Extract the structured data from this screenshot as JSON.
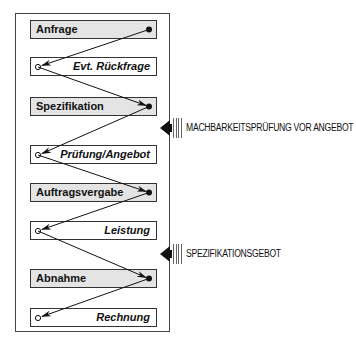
{
  "diagram": {
    "steps": [
      {
        "label": "Anfrage",
        "kind": "action",
        "endpoint": "filled-dot"
      },
      {
        "label": "Evt. Rückfrage",
        "kind": "response",
        "endpoint": "open-circle"
      },
      {
        "label": "Spezifikation",
        "kind": "action",
        "endpoint": "filled-dot"
      },
      {
        "label": "Prüfung/Angebot",
        "kind": "response",
        "endpoint": "open-circle"
      },
      {
        "label": "Auftragsvergabe",
        "kind": "action",
        "endpoint": "filled-dot"
      },
      {
        "label": "Leistung",
        "kind": "response",
        "endpoint": "open-circle"
      },
      {
        "label": "Abnahme",
        "kind": "action",
        "endpoint": "filled-dot"
      },
      {
        "label": "Rechnung",
        "kind": "response",
        "endpoint": "open-circle"
      }
    ],
    "side_notes": [
      {
        "label": "MACHBARKEITSPRÜFUNG VOR ANGEBOT",
        "between": [
          "Spezifikation",
          "Prüfung/Angebot"
        ]
      },
      {
        "label": "SPEZIFIKATIONSGEBOT",
        "between": [
          "Leistung",
          "Abnahme"
        ]
      }
    ],
    "colors": {
      "action_fill": "#e4e4e4",
      "response_fill": "#ffffff",
      "line": "#111111"
    }
  }
}
